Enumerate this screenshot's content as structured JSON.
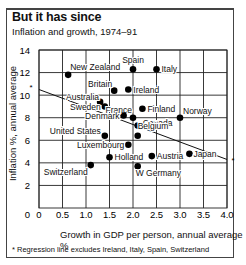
{
  "title": "But it has since",
  "subtitle": "Inflation and growth, 1974–91",
  "xlabel": "Growth in GDP per person, annual average %",
  "ylabel": "Inflation %, annual average",
  "footnote": "* Regression line excludes Ireland, Italy, Spain, Switzerland",
  "chart_data": {
    "type": "scatter",
    "title": "But it has since",
    "subtitle": "Inflation and growth, 1974–91",
    "xlabel": "Growth in GDP per person, annual average %",
    "ylabel": "Inflation %, annual average",
    "xlim": [
      0,
      4.0
    ],
    "ylim": [
      0,
      14
    ],
    "xticks": [
      "0",
      "0.5",
      "1.0",
      "1.5",
      "2.0",
      "2.5",
      "3.0",
      "3.5",
      "4.0"
    ],
    "yticks": [
      "2",
      "4",
      "6",
      "8",
      "10",
      "12",
      "14"
    ],
    "grid": true,
    "points": [
      {
        "label": "New Zealand",
        "x": 0.62,
        "y": 11.8
      },
      {
        "label": "Spain",
        "x": 2.0,
        "y": 12.3
      },
      {
        "label": "Italy",
        "x": 2.5,
        "y": 12.3
      },
      {
        "label": "Britain",
        "x": 1.6,
        "y": 10.4
      },
      {
        "label": "Ireland",
        "x": 1.9,
        "y": 10.5
      },
      {
        "label": "Australia",
        "x": 1.3,
        "y": 9.4
      },
      {
        "label": "Sweden",
        "x": 1.4,
        "y": 9.0
      },
      {
        "label": "Finland",
        "x": 2.2,
        "y": 8.8
      },
      {
        "label": "France",
        "x": 2.0,
        "y": 8.0
      },
      {
        "label": "Denmark",
        "x": 1.8,
        "y": 8.2
      },
      {
        "label": "Norway",
        "x": 3.0,
        "y": 8.0
      },
      {
        "label": "Canada",
        "x": 2.1,
        "y": 7.3
      },
      {
        "label": "Belgium",
        "x": 2.1,
        "y": 6.4
      },
      {
        "label": "United States",
        "x": 1.4,
        "y": 6.4
      },
      {
        "label": "Luxembourg",
        "x": 1.9,
        "y": 5.6
      },
      {
        "label": "Holland",
        "x": 1.5,
        "y": 4.5
      },
      {
        "label": "Austria",
        "x": 2.4,
        "y": 4.6
      },
      {
        "label": "Japan",
        "x": 3.2,
        "y": 4.8
      },
      {
        "label": "Switzerland",
        "x": 1.1,
        "y": 3.8
      },
      {
        "label": "W Germany",
        "x": 2.1,
        "y": 3.7
      }
    ],
    "regression_line": {
      "x": [
        0,
        4.0
      ],
      "y": [
        10.5,
        4.3
      ],
      "marker": "*"
    },
    "annotations": [
      "*"
    ]
  }
}
